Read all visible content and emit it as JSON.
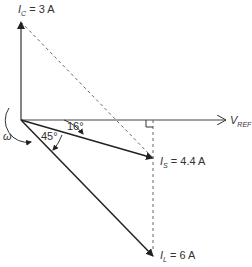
{
  "diagram": {
    "type": "phasor-diagram",
    "labels": {
      "ic_main": "I",
      "ic_sub": "C",
      "ic_value": " = 3 A",
      "is_main": "I",
      "is_sub": "S",
      "is_value": " = 4.4 A",
      "il_main": "I",
      "il_sub": "L",
      "il_value": " = 6 A",
      "vref_main": "V",
      "vref_sub": "REF",
      "omega": "ω",
      "angle_small": "16°",
      "angle_large": "45°"
    },
    "phasors": [
      {
        "name": "I_C",
        "magnitude": "3 A",
        "direction": "vertical up"
      },
      {
        "name": "I_S",
        "magnitude": "4.4 A",
        "angle_deg": -16
      },
      {
        "name": "I_L",
        "magnitude": "6 A",
        "angle_deg": -45
      },
      {
        "name": "V_REF",
        "direction": "horizontal right"
      }
    ],
    "colors": {
      "line": "#333333",
      "dashed": "#555555"
    }
  }
}
